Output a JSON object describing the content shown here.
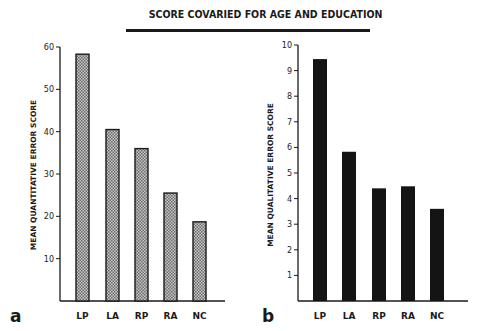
{
  "title": "SCORE COVARIED FOR AGE AND EDUCATION",
  "chart_data": [
    {
      "type": "bar",
      "panel": "a",
      "title": "SCORE COVARIED FOR AGE AND EDUCATION",
      "xlabel": "",
      "ylabel": "MEAN QUANTITATIVE ERROR SCORE",
      "categories": [
        "LP",
        "LA",
        "RP",
        "RA",
        "NC"
      ],
      "values": [
        58.3,
        40.5,
        36.0,
        25.5,
        18.7
      ],
      "ylim": [
        0,
        60
      ],
      "yticks": [
        10,
        20,
        30,
        40,
        50,
        60
      ],
      "grid": false,
      "legend": null,
      "bar_fill": "hatched gray"
    },
    {
      "type": "bar",
      "panel": "b",
      "title": "SCORE COVARIED FOR AGE AND EDUCATION",
      "xlabel": "",
      "ylabel": "MEAN QUALITATIVE ERROR SCORE",
      "categories": [
        "LP",
        "LA",
        "RP",
        "RA",
        "NC"
      ],
      "values": [
        9.45,
        5.83,
        4.4,
        4.48,
        3.6
      ],
      "ylim": [
        0,
        10
      ],
      "yticks": [
        1,
        2,
        3,
        4,
        5,
        6,
        7,
        8,
        9,
        10
      ],
      "grid": false,
      "legend": null,
      "bar_fill": "solid black"
    }
  ],
  "panels": {
    "a": {
      "letter": "a",
      "ylabel": "MEAN QUANTITATIVE ERROR SCORE",
      "yticks": [
        "10",
        "20",
        "30",
        "40",
        "50",
        "60"
      ],
      "categories": [
        "LP",
        "LA",
        "RP",
        "RA",
        "NC"
      ]
    },
    "b": {
      "letter": "b",
      "ylabel": "MEAN QUALITATIVE ERROR SCORE",
      "yticks": [
        "1",
        "2",
        "3",
        "4",
        "5",
        "6",
        "7",
        "8",
        "9",
        "10"
      ],
      "categories": [
        "LP",
        "LA",
        "RP",
        "RA",
        "NC"
      ]
    }
  },
  "colors": {
    "ink": "#1a1a1a",
    "hatch_light": "#d0d0d0",
    "hatch_dark": "#6a6a6a",
    "solid_bar": "#141414"
  }
}
